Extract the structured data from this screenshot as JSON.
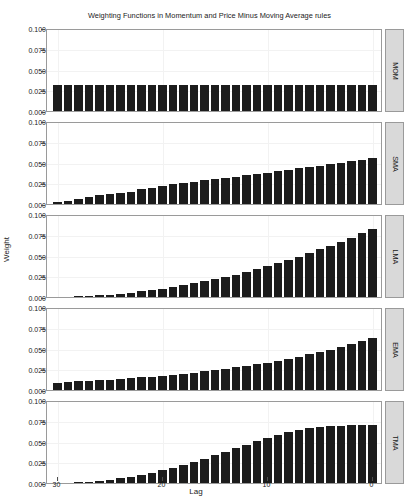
{
  "chart_data": {
    "type": "bar",
    "title": "Weighting Functions in Momentum and Price Minus Moving Average rules",
    "xlabel": "Lag",
    "ylabel": "Weight",
    "grid": true,
    "legend": "none",
    "x_reversed": true,
    "xlim": [
      31,
      -1
    ],
    "ylim": [
      0.0,
      0.1
    ],
    "xticks": [
      30,
      20,
      10,
      0
    ],
    "xtick_labels": [
      "30",
      "20",
      "10",
      "0"
    ],
    "yticks": [
      0.0,
      0.025,
      0.05,
      0.075,
      0.1
    ],
    "ytick_labels": [
      "0.000",
      "0.025",
      "0.050",
      "0.075",
      "0.100"
    ],
    "bar_color": "#1c1c1c",
    "panel_background": "#ffffff",
    "strip_background": "#d9d9d9",
    "x": [
      30,
      29,
      28,
      27,
      26,
      25,
      24,
      23,
      22,
      21,
      20,
      19,
      18,
      17,
      16,
      15,
      14,
      13,
      12,
      11,
      10,
      9,
      8,
      7,
      6,
      5,
      4,
      3,
      2,
      1,
      0
    ],
    "panels": [
      {
        "label": "MOM",
        "values": [
          0.0312,
          0.0312,
          0.0312,
          0.0312,
          0.0312,
          0.0312,
          0.0312,
          0.0312,
          0.0312,
          0.0312,
          0.0312,
          0.0312,
          0.0312,
          0.0312,
          0.0312,
          0.0312,
          0.0312,
          0.0312,
          0.0312,
          0.0312,
          0.0312,
          0.0312,
          0.0312,
          0.0312,
          0.0312,
          0.0312,
          0.0312,
          0.0312,
          0.0312,
          0.0312,
          0.0312
        ]
      },
      {
        "label": "SMA",
        "values": [
          0.002,
          0.0041,
          0.0062,
          0.0083,
          0.0104,
          0.0124,
          0.0133,
          0.0145,
          0.0175,
          0.0196,
          0.0216,
          0.0237,
          0.025,
          0.0268,
          0.0289,
          0.03,
          0.0318,
          0.0331,
          0.035,
          0.0362,
          0.0378,
          0.0397,
          0.0415,
          0.043,
          0.0447,
          0.0462,
          0.048,
          0.0497,
          0.0515,
          0.0533,
          0.0549
        ]
      },
      {
        "label": "LMA",
        "values": [
          0.0002,
          0.0004,
          0.0008,
          0.0013,
          0.0021,
          0.003,
          0.004,
          0.0053,
          0.0067,
          0.0082,
          0.01,
          0.0119,
          0.014,
          0.0163,
          0.0187,
          0.0213,
          0.0241,
          0.0271,
          0.0303,
          0.0336,
          0.0371,
          0.0408,
          0.0446,
          0.0487,
          0.0529,
          0.0573,
          0.0618,
          0.0666,
          0.0715,
          0.0766,
          0.0819
        ]
      },
      {
        "label": "EMA",
        "values": [
          0.009,
          0.0098,
          0.0103,
          0.011,
          0.0118,
          0.0125,
          0.0133,
          0.0142,
          0.0152,
          0.0162,
          0.0173,
          0.0184,
          0.0197,
          0.021,
          0.0224,
          0.0239,
          0.0255,
          0.0272,
          0.029,
          0.031,
          0.033,
          0.0352,
          0.0376,
          0.0401,
          0.0428,
          0.0456,
          0.0487,
          0.0519,
          0.0554,
          0.0591,
          0.063
        ]
      },
      {
        "label": "TMA",
        "values": [
          0.0002,
          0.0005,
          0.001,
          0.0018,
          0.0028,
          0.0041,
          0.0057,
          0.0076,
          0.0098,
          0.0123,
          0.0151,
          0.0182,
          0.0216,
          0.0252,
          0.0291,
          0.0332,
          0.0375,
          0.0419,
          0.0463,
          0.0506,
          0.0546,
          0.0582,
          0.0613,
          0.0639,
          0.0659,
          0.0674,
          0.0684,
          0.069,
          0.0694,
          0.0696,
          0.0697
        ]
      }
    ]
  }
}
